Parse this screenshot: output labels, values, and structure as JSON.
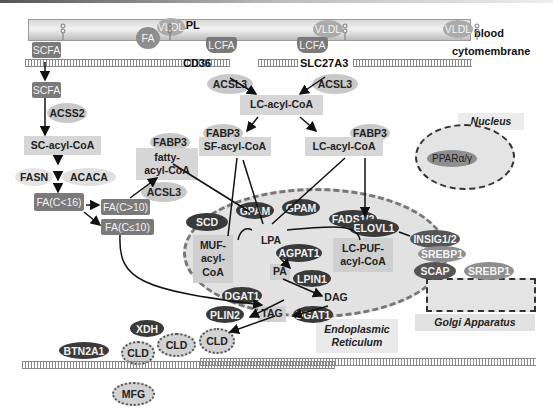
{
  "compartments": {
    "blood": "blood",
    "cytomembrane": "cytomembrane",
    "nucleus": "Nucleus",
    "golgi": "Golgi Apparatus",
    "er_line1": "Endoplasmic",
    "er_line2": "Reticulum"
  },
  "blood_vessel": {
    "lpl": "LPL",
    "fa": "FA",
    "vldl": [
      "VLDL",
      "VLDL",
      "VLDL"
    ]
  },
  "transporters": {
    "cd36": "CD36",
    "slc27a3": "SLC27A3"
  },
  "metabolites": {
    "scfa_top": "SCFA",
    "scfa_inner": "SCFA",
    "lcfa_1": "LCFA",
    "lcfa_2": "LCFA",
    "sc_acyl_coa": "SC-acyl-CoA",
    "lc_acyl_coa_top": "LC-acyl-CoA",
    "sf_acyl_coa": "SF-acyl-CoA",
    "lc_acyl_coa_right": "LC-acyl-CoA",
    "fatty_acyl_coa_1": "fatty-",
    "fatty_acyl_coa_2": "acyl-CoA",
    "fa_c16": "FA(C<16)",
    "fa_c_gt10": "FA(C>10)",
    "fa_c_le10": "FA(C≤10)",
    "muf_1": "MUF-",
    "muf_2": "acyl-",
    "muf_3": "CoA",
    "lpa": "LPA",
    "pa": "PA",
    "dag": "DAG",
    "tag": "TAG",
    "lc_puf_1": "LC-PUF-",
    "lc_puf_2": "acyl-CoA"
  },
  "enzymes": {
    "acss2": "ACSS2",
    "fasn": "FASN",
    "acaca": "ACACA",
    "acsl3_left": "ACSL3",
    "acsl3_cd36": "ACSL3",
    "acsl3_slc": "ACSL3",
    "fabp3_left": "FABP3",
    "fabp3_mid": "FABP3",
    "fabp3_right": "FABP3",
    "scd": "SCD",
    "gpam_1": "GPAM",
    "gpam_2": "GPAM",
    "fads": "FADS1/2",
    "elovl1": "ELOVL1",
    "agpat1": "AGPAT1",
    "lpin1": "LPIN1",
    "dgat1_1": "DGAT1",
    "dgat1_2": "DGAT1",
    "plin2": "PLIN2",
    "insig": "INSIG1/2",
    "srebp1_a": "SREBP1",
    "srebp1_b": "SREBP1",
    "scap": "SCAP",
    "ppar": "PPARα/γ",
    "xdh": "XDH",
    "btn2a1": "BTN2A1"
  },
  "droplets": {
    "cld": [
      "CLD",
      "CLD",
      "CLD"
    ],
    "mfg": "MFG"
  },
  "colors": {
    "light_box": "#d6d6d6",
    "dark_box": "#7a7a7a",
    "dark_ellipse": "#3a3a3a",
    "mid_ellipse": "#8e8e8e",
    "light_ellipse": "#c8c8c8"
  }
}
